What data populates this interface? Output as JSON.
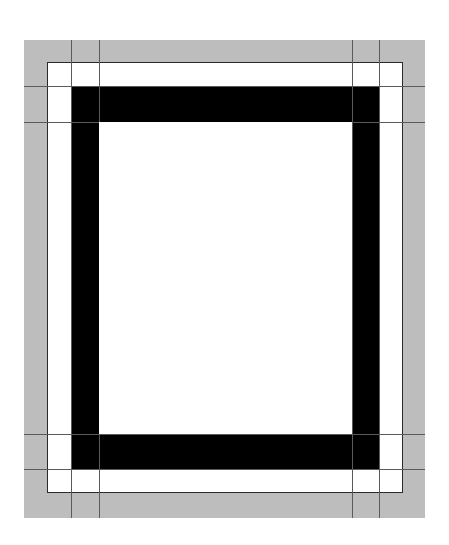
{
  "diagram": {
    "colors": {
      "outer_band": "#bdbdbd",
      "inner_field": "#ffffff",
      "ring": "#000000",
      "outline": "#2a2a2a",
      "grid_line": "#5a5a5a"
    },
    "outer_band": {
      "x": 24,
      "y": 40,
      "w": 401,
      "h": 478
    },
    "inner_field": {
      "x": 47,
      "y": 62,
      "w": 356,
      "h": 431
    },
    "ring": {
      "outer": {
        "x": 71,
        "y": 86,
        "w": 308,
        "h": 384
      },
      "thickness_x": 28,
      "thickness_y": 36
    },
    "grid": {
      "vertical_x": [
        71,
        99,
        352,
        379
      ],
      "horizontal_y": [
        86,
        122,
        434,
        469
      ]
    }
  }
}
